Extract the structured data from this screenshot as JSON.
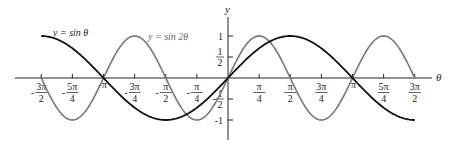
{
  "chart_data": {
    "type": "line",
    "title": "",
    "xlabel": "θ",
    "ylabel": "y",
    "xlim": [
      -4.712,
      4.712
    ],
    "ylim": [
      -1,
      1
    ],
    "grid": false,
    "legend": "inline labels",
    "x_ticks": [
      {
        "value": -4.712,
        "num": "3π",
        "den": "2",
        "neg": true
      },
      {
        "value": -3.927,
        "num": "5π",
        "den": "4",
        "neg": true
      },
      {
        "value": -3.1416,
        "num": "π",
        "den": "",
        "neg": true
      },
      {
        "value": -2.356,
        "num": "3π",
        "den": "4",
        "neg": true
      },
      {
        "value": -1.5708,
        "num": "π",
        "den": "2",
        "neg": true
      },
      {
        "value": -0.7854,
        "num": "π",
        "den": "4",
        "neg": true
      },
      {
        "value": 0.7854,
        "num": "π",
        "den": "4",
        "neg": false
      },
      {
        "value": 1.5708,
        "num": "π",
        "den": "2",
        "neg": false
      },
      {
        "value": 2.356,
        "num": "3π",
        "den": "4",
        "neg": false
      },
      {
        "value": 3.1416,
        "num": "π",
        "den": "",
        "neg": false
      },
      {
        "value": 3.927,
        "num": "5π",
        "den": "4",
        "neg": false
      },
      {
        "value": 4.712,
        "num": "3π",
        "den": "2",
        "neg": false
      }
    ],
    "y_ticks": [
      {
        "value": 1,
        "num": "1",
        "den": "",
        "neg": false
      },
      {
        "value": 0.5,
        "num": "1",
        "den": "2",
        "neg": false
      },
      {
        "value": -0.5,
        "num": "1",
        "den": "2",
        "neg": true
      },
      {
        "value": -1,
        "num": "1",
        "den": "",
        "neg": true
      }
    ],
    "series": [
      {
        "name": "y = sin θ",
        "label": "y = sin θ",
        "function": "sin(x)",
        "color": "#111111",
        "domain": [
          -4.712,
          4.712
        ],
        "x": [
          -4.712,
          -3.927,
          -3.1416,
          -2.356,
          -1.5708,
          -0.7854,
          0,
          0.7854,
          1.5708,
          2.356,
          3.1416,
          3.927,
          4.712
        ],
        "values": [
          1,
          0.707,
          0,
          -0.707,
          -1,
          -0.707,
          0,
          0.707,
          1,
          0.707,
          0,
          -0.707,
          -1
        ]
      },
      {
        "name": "y = sin 2θ",
        "label": "y = sin 2θ",
        "function": "sin(2x)",
        "color": "#777777",
        "domain": [
          -4.712,
          4.712
        ],
        "x": [
          -4.712,
          -3.927,
          -3.1416,
          -2.356,
          -1.5708,
          -0.7854,
          0,
          0.7854,
          1.5708,
          2.356,
          3.1416,
          3.927,
          4.712
        ],
        "values": [
          0,
          -1,
          0,
          1,
          0,
          -1,
          0,
          1,
          0,
          -1,
          0,
          1,
          0
        ]
      }
    ]
  },
  "labels": {
    "y_axis": "y",
    "x_axis": "θ",
    "sin_theta": "y = sin θ",
    "sin_2theta": "y = sin 2θ"
  }
}
